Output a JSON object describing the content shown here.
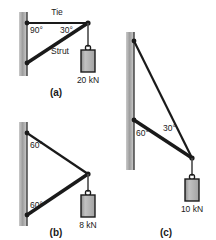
{
  "figure": {
    "background_color": "#ffffff",
    "member_color": "#1a1a1a",
    "wall_color": "#9a9a9a",
    "wall_edge_color": "#3a3a3a",
    "weight_fill_color": "#b8b8b8",
    "weight_border_color": "#1a1a1a",
    "text_color": "#1a1a1a"
  },
  "diagrams": [
    {
      "caption": "(a)",
      "angles": [
        {
          "value": "90°"
        },
        {
          "value": "30°"
        }
      ],
      "members": [
        {
          "name": "Tie",
          "label": "Tie",
          "kind": "tie"
        },
        {
          "name": "Strut",
          "label": "Strut",
          "kind": "strut"
        }
      ],
      "load": {
        "label": "20 kN",
        "magnitude": 20,
        "unit": "kN"
      }
    },
    {
      "caption": "(b)",
      "angles": [
        {
          "value": "60°"
        },
        {
          "value": "60°"
        }
      ],
      "members": [
        {
          "name": "Tie",
          "label": "",
          "kind": "tie"
        },
        {
          "name": "Strut",
          "label": "",
          "kind": "strut"
        }
      ],
      "load": {
        "label": "8 kN",
        "magnitude": 8,
        "unit": "kN"
      }
    },
    {
      "caption": "(c)",
      "angles": [
        {
          "value": "60°"
        },
        {
          "value": "30°"
        }
      ],
      "members": [
        {
          "name": "Tie",
          "label": "",
          "kind": "tie"
        },
        {
          "name": "Strut",
          "label": "",
          "kind": "strut"
        }
      ],
      "load": {
        "label": "10 kN",
        "magnitude": 10,
        "unit": "kN"
      }
    }
  ]
}
